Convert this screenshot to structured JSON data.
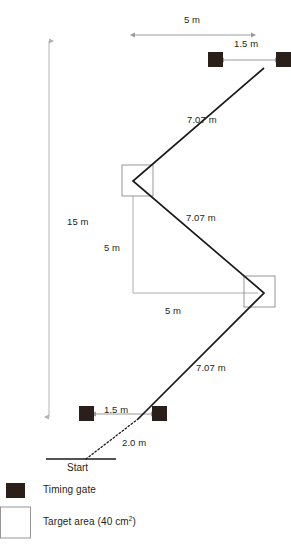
{
  "figure": {
    "kind": "agility-course-diagram",
    "colors": {
      "gate_fill": "#2b1f1a",
      "path_line": "#1a1a1a",
      "dimension_line": "#9a9a9a",
      "target_box_stroke": "#8c8c8c",
      "text": "#231f20",
      "background": "#ffffff"
    }
  },
  "dimensions": {
    "top_width": "5 m",
    "top_gate_gap": "1.5 m",
    "total_length": "15 m",
    "mid_vertical": "5 m",
    "mid_horizontal": "5 m",
    "diagonal_top": "7.07 m",
    "diagonal_middle": "7.07 m",
    "diagonal_bottom": "7.07 m",
    "bottom_gate_gap": "1.5 m",
    "start_run": "2.0 m"
  },
  "labels": {
    "start": "Start"
  },
  "legend": {
    "items": [
      {
        "id": "timing-gate",
        "swatch": "filled-square",
        "label": "Timing gate"
      },
      {
        "id": "target-area",
        "swatch": "outlined-square",
        "label": "Target area (40 cm",
        "sup": "2",
        "label_tail": ")"
      }
    ]
  },
  "elements": {
    "timing_gates": [
      {
        "id": "gate-top-left",
        "x": 208,
        "y": 52,
        "w": 15,
        "h": 15
      },
      {
        "id": "gate-top-right",
        "x": 276,
        "y": 52,
        "w": 15,
        "h": 15
      },
      {
        "id": "gate-bottom-left",
        "x": 79,
        "y": 406,
        "w": 15,
        "h": 15
      },
      {
        "id": "gate-bottom-right",
        "x": 152,
        "y": 406,
        "w": 15,
        "h": 15
      }
    ],
    "target_areas": [
      {
        "id": "target-upper",
        "x": 122,
        "y": 165,
        "w": 31,
        "h": 31
      },
      {
        "id": "target-lower",
        "x": 244,
        "y": 276,
        "w": 31,
        "h": 31
      }
    ]
  }
}
